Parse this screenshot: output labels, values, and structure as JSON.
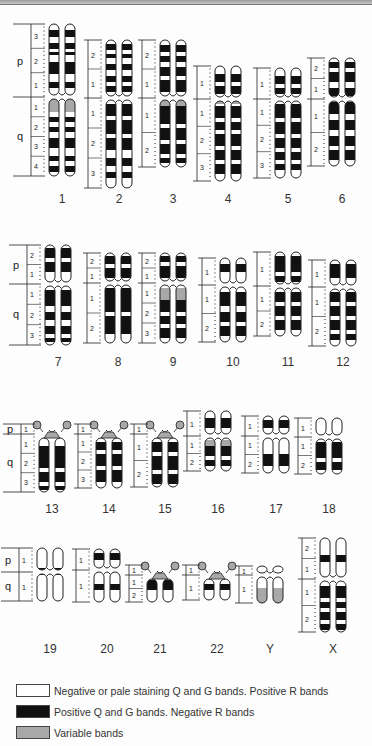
{
  "header": {
    "cutoff_text": ""
  },
  "colors": {
    "negative": "#ffffff",
    "positive": "#111111",
    "variable": "#a8a8a8",
    "outline": "#222222"
  },
  "axis_arm_labels": {
    "p": "p",
    "q": "q"
  },
  "chromosomes": [
    {
      "id": "1",
      "label": "1",
      "row": 1,
      "x": 62,
      "top": 24,
      "cen": 97,
      "bottom": 176,
      "labelY": 192,
      "arms": {
        "p": true,
        "q": true
      },
      "pRegions": [
        "3",
        "2",
        "1"
      ],
      "qRegions": [
        "1",
        "2",
        "3",
        "4"
      ],
      "bands": [
        [
          30,
          37,
          "k"
        ],
        [
          43,
          49,
          "k"
        ],
        [
          52,
          55,
          "k"
        ],
        [
          62,
          74,
          "k"
        ],
        [
          82,
          88,
          "k"
        ],
        [
          99,
          112,
          "v"
        ],
        [
          117,
          122,
          "k"
        ],
        [
          127,
          132,
          "k"
        ],
        [
          138,
          148,
          "k"
        ],
        [
          156,
          161,
          "k"
        ],
        [
          166,
          172,
          "k"
        ]
      ]
    },
    {
      "id": "2",
      "label": "2",
      "row": 1,
      "x": 119,
      "top": 40,
      "cen": 98,
      "bottom": 188,
      "labelY": 192,
      "arms": {},
      "pRegions": [
        "2",
        "1"
      ],
      "qRegions": [
        "1",
        "2",
        "3"
      ],
      "bands": [
        [
          44,
          50,
          "k"
        ],
        [
          54,
          58,
          "k"
        ],
        [
          64,
          70,
          "k"
        ],
        [
          76,
          82,
          "k"
        ],
        [
          86,
          92,
          "k"
        ],
        [
          104,
          116,
          "k"
        ],
        [
          120,
          134,
          "k"
        ],
        [
          138,
          150,
          "k"
        ],
        [
          158,
          166,
          "k"
        ],
        [
          172,
          178,
          "k"
        ]
      ]
    },
    {
      "id": "3",
      "label": "3",
      "row": 1,
      "x": 173,
      "top": 40,
      "cen": 98,
      "bottom": 167,
      "labelY": 192,
      "arms": {},
      "pRegions": [
        "2",
        "1"
      ],
      "qRegions": [
        "1",
        "2"
      ],
      "bands": [
        [
          45,
          52,
          "k"
        ],
        [
          56,
          62,
          "k"
        ],
        [
          67,
          76,
          "k"
        ],
        [
          80,
          92,
          "k"
        ],
        [
          100,
          106,
          "v"
        ],
        [
          106,
          124,
          "k"
        ],
        [
          128,
          140,
          "k"
        ],
        [
          144,
          154,
          "k"
        ],
        [
          158,
          163,
          "k"
        ]
      ]
    },
    {
      "id": "4",
      "label": "4",
      "row": 1,
      "x": 228,
      "top": 66,
      "cen": 99,
      "bottom": 181,
      "labelY": 192,
      "arms": {},
      "pRegions": [
        "1"
      ],
      "qRegions": [
        "1",
        "2",
        "3"
      ],
      "bands": [
        [
          74,
          82,
          "k"
        ],
        [
          86,
          94,
          "k"
        ],
        [
          100,
          104,
          "v"
        ],
        [
          106,
          118,
          "k"
        ],
        [
          122,
          130,
          "k"
        ],
        [
          134,
          146,
          "k"
        ],
        [
          150,
          160,
          "k"
        ],
        [
          164,
          174,
          "k"
        ]
      ]
    },
    {
      "id": "5",
      "label": "5",
      "row": 1,
      "x": 288,
      "top": 68,
      "cen": 99,
      "bottom": 178,
      "labelY": 192,
      "arms": {},
      "pRegions": [
        "1"
      ],
      "qRegions": [
        "1",
        "2",
        "3"
      ],
      "bands": [
        [
          76,
          84,
          "k"
        ],
        [
          88,
          94,
          "k"
        ],
        [
          104,
          118,
          "k"
        ],
        [
          122,
          134,
          "k"
        ],
        [
          138,
          148,
          "k"
        ],
        [
          152,
          160,
          "k"
        ],
        [
          164,
          170,
          "k"
        ]
      ]
    },
    {
      "id": "6",
      "label": "6",
      "row": 1,
      "x": 342,
      "top": 58,
      "cen": 99,
      "bottom": 166,
      "labelY": 192,
      "arms": {},
      "pRegions": [
        "2",
        "1"
      ],
      "qRegions": [
        "1",
        "2"
      ],
      "bands": [
        [
          62,
          68,
          "k"
        ],
        [
          72,
          82,
          "k"
        ],
        [
          88,
          96,
          "k"
        ],
        [
          102,
          114,
          "k"
        ],
        [
          120,
          130,
          "k"
        ],
        [
          136,
          146,
          "k"
        ],
        [
          150,
          160,
          "k"
        ]
      ]
    },
    {
      "id": "7",
      "label": "7",
      "row": 2,
      "x": 58,
      "top": 245,
      "cen": 284,
      "bottom": 345,
      "labelY": 355,
      "arms": {
        "p": true,
        "q": true
      },
      "pRegions": [
        "2",
        "1"
      ],
      "qRegions": [
        "1",
        "2",
        "3"
      ],
      "bands": [
        [
          248,
          258,
          "k"
        ],
        [
          262,
          272,
          "k"
        ],
        [
          290,
          306,
          "k"
        ],
        [
          312,
          320,
          "k"
        ],
        [
          326,
          334,
          "k"
        ],
        [
          338,
          342,
          "k"
        ]
      ]
    },
    {
      "id": "8",
      "label": "8",
      "row": 2,
      "x": 118,
      "top": 253,
      "cen": 283,
      "bottom": 343,
      "labelY": 355,
      "arms": {},
      "pRegions": [
        "2",
        "1"
      ],
      "qRegions": [
        "1",
        "2"
      ],
      "bands": [
        [
          256,
          264,
          "k"
        ],
        [
          268,
          278,
          "k"
        ],
        [
          288,
          312,
          "k"
        ],
        [
          316,
          334,
          "k"
        ]
      ]
    },
    {
      "id": "9",
      "label": "9",
      "row": 2,
      "x": 173,
      "top": 253,
      "cen": 283,
      "bottom": 343,
      "labelY": 355,
      "arms": {},
      "pRegions": [
        "2",
        "1"
      ],
      "qRegions": [
        "1",
        "2",
        "3"
      ],
      "bands": [
        [
          256,
          262,
          "k"
        ],
        [
          266,
          278,
          "k"
        ],
        [
          288,
          300,
          "v"
        ],
        [
          300,
          312,
          "k"
        ],
        [
          316,
          324,
          "k"
        ],
        [
          328,
          338,
          "k"
        ]
      ]
    },
    {
      "id": "10",
      "label": "10",
      "row": 2,
      "x": 233,
      "top": 258,
      "cen": 285,
      "bottom": 342,
      "labelY": 355,
      "arms": {},
      "pRegions": [
        "1"
      ],
      "qRegions": [
        "1",
        "2"
      ],
      "bands": [
        [
          264,
          272,
          "k"
        ],
        [
          292,
          306,
          "k"
        ],
        [
          312,
          322,
          "k"
        ],
        [
          326,
          336,
          "k"
        ]
      ]
    },
    {
      "id": "11",
      "label": "11",
      "row": 2,
      "x": 288,
      "top": 252,
      "cen": 286,
      "bottom": 336,
      "labelY": 355,
      "arms": {},
      "pRegions": [
        "1"
      ],
      "qRegions": [
        "1",
        "2"
      ],
      "bands": [
        [
          256,
          272,
          "k"
        ],
        [
          276,
          282,
          "k"
        ],
        [
          292,
          302,
          "k"
        ],
        [
          306,
          316,
          "k"
        ],
        [
          320,
          330,
          "k"
        ]
      ]
    },
    {
      "id": "12",
      "label": "12",
      "row": 2,
      "x": 343,
      "top": 260,
      "cen": 287,
      "bottom": 346,
      "labelY": 355,
      "arms": {},
      "pRegions": [
        "1"
      ],
      "qRegions": [
        "1",
        "2"
      ],
      "bands": [
        [
          264,
          278,
          "k"
        ],
        [
          292,
          302,
          "k"
        ],
        [
          306,
          316,
          "k"
        ],
        [
          320,
          330,
          "k"
        ],
        [
          334,
          340,
          "k"
        ]
      ]
    },
    {
      "id": "13",
      "label": "13",
      "row": 3,
      "x": 52,
      "top": 425,
      "cen": 434,
      "bottom": 492,
      "labelY": 502,
      "arms": {
        "p": true,
        "q": true
      },
      "acro": true,
      "pRegions": [
        "1"
      ],
      "qRegions": [
        "1",
        "2",
        "3"
      ],
      "bands": [
        [
          446,
          468,
          "k"
        ],
        [
          472,
          482,
          "k"
        ],
        [
          486,
          490,
          "k"
        ]
      ]
    },
    {
      "id": "14",
      "label": "14",
      "row": 3,
      "x": 109,
      "top": 425,
      "cen": 434,
      "bottom": 488,
      "labelY": 502,
      "arms": {},
      "acro": true,
      "pRegions": [
        "1"
      ],
      "qRegions": [
        "1",
        "2",
        "3"
      ],
      "bands": [
        [
          442,
          450,
          "k"
        ],
        [
          454,
          466,
          "k"
        ],
        [
          470,
          482,
          "k"
        ]
      ]
    },
    {
      "id": "15",
      "label": "15",
      "row": 3,
      "x": 165,
      "top": 425,
      "cen": 434,
      "bottom": 487,
      "labelY": 502,
      "arms": {},
      "acro": true,
      "pRegions": [
        "1"
      ],
      "qRegions": [
        "1",
        "2"
      ],
      "bands": [
        [
          442,
          452,
          "k"
        ],
        [
          456,
          470,
          "k"
        ],
        [
          474,
          484,
          "k"
        ]
      ]
    },
    {
      "id": "16",
      "label": "16",
      "row": 3,
      "x": 218,
      "top": 411,
      "cen": 436,
      "bottom": 471,
      "labelY": 502,
      "arms": {},
      "pRegions": [
        "1"
      ],
      "qRegions": [
        "1",
        "2"
      ],
      "bands": [
        [
          418,
          428,
          "k"
        ],
        [
          440,
          446,
          "v"
        ],
        [
          446,
          456,
          "k"
        ],
        [
          460,
          466,
          "k"
        ]
      ]
    },
    {
      "id": "17",
      "label": "17",
      "row": 3,
      "x": 276,
      "top": 416,
      "cen": 436,
      "bottom": 473,
      "labelY": 502,
      "arms": {},
      "pRegions": [
        "1"
      ],
      "qRegions": [
        "1",
        "2"
      ],
      "bands": [
        [
          420,
          428,
          "k"
        ],
        [
          454,
          466,
          "k"
        ]
      ]
    },
    {
      "id": "18",
      "label": "18",
      "row": 3,
      "x": 329,
      "top": 418,
      "cen": 437,
      "bottom": 474,
      "labelY": 502,
      "arms": {},
      "pRegions": [
        "1"
      ],
      "qRegions": [
        "1",
        "2"
      ],
      "bands": [
        [
          442,
          458,
          "k"
        ],
        [
          462,
          470,
          "k"
        ]
      ]
    },
    {
      "id": "19",
      "label": "19",
      "row": 4,
      "x": 50,
      "top": 548,
      "cen": 572,
      "bottom": 601,
      "labelY": 642,
      "arms": {
        "p": true,
        "q": true
      },
      "pRegions": [
        "1"
      ],
      "qRegions": [
        "1"
      ],
      "bands": [
        [
          568,
          575,
          "k"
        ]
      ]
    },
    {
      "id": "20",
      "label": "20",
      "row": 4,
      "x": 107,
      "top": 549,
      "cen": 570,
      "bottom": 602,
      "labelY": 642,
      "arms": {},
      "pRegions": [
        "1"
      ],
      "qRegions": [
        "1"
      ],
      "bands": [
        [
          553,
          560,
          "k"
        ],
        [
          584,
          590,
          "k"
        ]
      ]
    },
    {
      "id": "21",
      "label": "21",
      "row": 4,
      "x": 160,
      "top": 570,
      "cen": 575,
      "bottom": 602,
      "labelY": 642,
      "arms": {},
      "acro": true,
      "pRegions": [
        "1"
      ],
      "qRegions": [
        "1",
        "2"
      ],
      "bands": [
        [
          580,
          590,
          "k"
        ]
      ]
    },
    {
      "id": "22",
      "label": "22",
      "row": 4,
      "x": 217,
      "top": 565,
      "cen": 575,
      "bottom": 600,
      "labelY": 642,
      "arms": {},
      "acro": true,
      "pRegions": [
        "1"
      ],
      "qRegions": [
        "1"
      ],
      "bands": [
        [
          584,
          590,
          "k"
        ]
      ]
    },
    {
      "id": "Y",
      "label": "Y",
      "row": 4,
      "x": 270,
      "top": 566,
      "cen": 575,
      "bottom": 603,
      "labelY": 642,
      "arms": {},
      "pRegions": [
        "1"
      ],
      "qRegions": [
        "1"
      ],
      "bands": [
        [
          588,
          603,
          "v"
        ]
      ]
    },
    {
      "id": "X",
      "label": "X",
      "row": 4,
      "x": 333,
      "top": 538,
      "cen": 579,
      "bottom": 632,
      "labelY": 642,
      "arms": {},
      "pRegions": [
        "2",
        "1"
      ],
      "qRegions": [
        "1",
        "2"
      ],
      "bands": [
        [
          555,
          562,
          "k"
        ],
        [
          586,
          598,
          "k"
        ],
        [
          602,
          608,
          "k"
        ],
        [
          612,
          620,
          "k"
        ],
        [
          624,
          630,
          "k"
        ]
      ]
    }
  ],
  "legend": {
    "items": [
      {
        "key": "negative",
        "text": "Negative or pale staining Q and G bands. Positive R bands"
      },
      {
        "key": "positive",
        "text": "Positive Q and G bands. Negative R bands"
      },
      {
        "key": "variable",
        "text": "Variable bands"
      }
    ]
  }
}
